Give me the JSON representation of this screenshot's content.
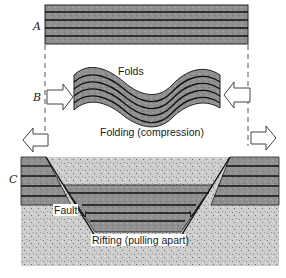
{
  "diagram": {
    "panel_labels": {
      "a": "A",
      "b": "B",
      "c": "C"
    },
    "annotations": {
      "folds": "Folds",
      "folding": "Folding (compression)",
      "fault": "Fault",
      "rifting": "Rifting (pulling apart)"
    },
    "colors": {
      "layer_fill": "#8f8f8f",
      "layer_line": "#111111",
      "basement_fill": "#c9c9c9",
      "arrow_fill": "#ffffff",
      "arrow_stroke": "#444444",
      "guide_line": "#555555"
    },
    "arrows": {
      "b_left": "arrow-right (compression)",
      "b_right": "arrow-left (compression)",
      "c_left": "arrow-left (extension)",
      "c_right": "arrow-right (extension)"
    }
  }
}
